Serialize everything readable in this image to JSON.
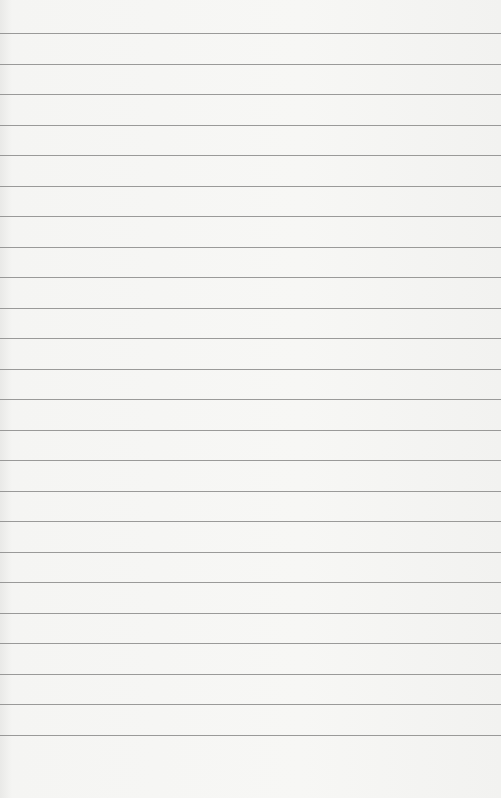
{
  "page": {
    "type": "blank lined paper",
    "background_color": "#f5f5f3",
    "rule_color": "#8a8a88",
    "rule_count": 24,
    "first_rule_y": 33,
    "rule_spacing": 30.5
  }
}
